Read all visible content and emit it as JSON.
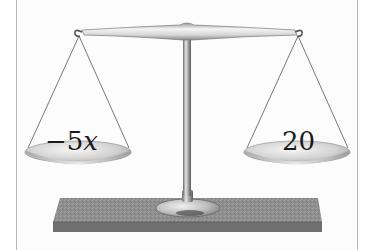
{
  "figure": {
    "type": "balance-scale",
    "left_pan": {
      "sign": "−",
      "coefficient": "5",
      "variable": "x"
    },
    "right_pan": {
      "value": "20"
    },
    "colors": {
      "metal_light": "#f2f2f2",
      "metal_mid": "#c8c8c8",
      "metal_dark": "#7a7a7a",
      "base_top": "#8e8e8e",
      "base_front": "#6e6e6e",
      "string": "#555555",
      "border": "#b8b8b8"
    }
  }
}
